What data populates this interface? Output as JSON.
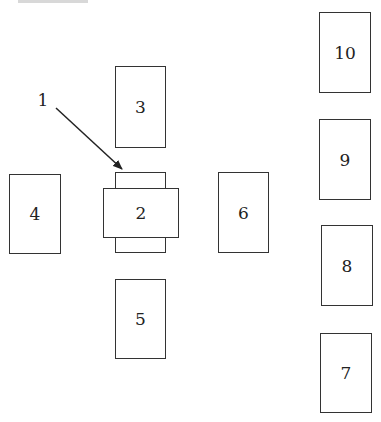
{
  "diagram": {
    "colors": {
      "stroke": "#333333",
      "text": "#222222",
      "background": "#ffffff"
    },
    "callout": {
      "label": "1",
      "x": 43,
      "y": 100,
      "target": "2"
    },
    "boxes": [
      {
        "id": "3",
        "label": "3",
        "x": 115,
        "y": 66,
        "w": 51,
        "h": 82
      },
      {
        "id": "2-back",
        "label": "",
        "x": 115,
        "y": 172,
        "w": 51,
        "h": 81
      },
      {
        "id": "2",
        "label": "2",
        "x": 103,
        "y": 188,
        "w": 76,
        "h": 50
      },
      {
        "id": "4",
        "label": "4",
        "x": 9,
        "y": 174,
        "w": 52,
        "h": 80
      },
      {
        "id": "6",
        "label": "6",
        "x": 218,
        "y": 172,
        "w": 51,
        "h": 81
      },
      {
        "id": "5",
        "label": "5",
        "x": 115,
        "y": 279,
        "w": 51,
        "h": 80
      },
      {
        "id": "10",
        "label": "10",
        "x": 319,
        "y": 12,
        "w": 52,
        "h": 81
      },
      {
        "id": "9",
        "label": "9",
        "x": 319,
        "y": 119,
        "w": 52,
        "h": 81
      },
      {
        "id": "8",
        "label": "8",
        "x": 321,
        "y": 225,
        "w": 52,
        "h": 81
      },
      {
        "id": "7",
        "label": "7",
        "x": 320,
        "y": 333,
        "w": 52,
        "h": 80
      }
    ],
    "arrow": {
      "from": [
        56,
        108
      ],
      "to": [
        122,
        169
      ]
    }
  }
}
